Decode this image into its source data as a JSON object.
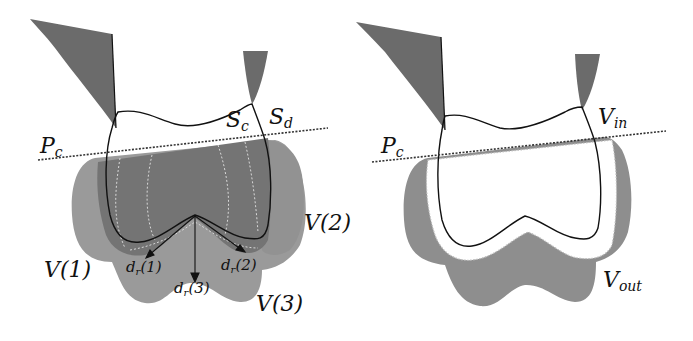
{
  "figure": {
    "panels": [
      {
        "id": "left",
        "labels": {
          "plane": {
            "main": "P",
            "sub": "c"
          },
          "surface_c": {
            "main": "S",
            "sub": "c"
          },
          "surface_d": {
            "main": "S",
            "sub": "d"
          },
          "volume_1": "V(1)",
          "volume_2": "V(2)",
          "volume_3": "V(3)",
          "dir_1": {
            "main": "d",
            "sub": "r",
            "tail": "(1)"
          },
          "dir_2": {
            "main": "d",
            "sub": "r",
            "tail": "(2)"
          },
          "dir_3": {
            "main": "d",
            "sub": "r",
            "tail": "(3)"
          }
        }
      },
      {
        "id": "right",
        "labels": {
          "plane": {
            "main": "P",
            "sub": "c"
          },
          "volume_in": {
            "main": "V",
            "sub": "in"
          },
          "volume_out": {
            "main": "V",
            "sub": "out"
          }
        }
      }
    ],
    "colors": {
      "background": "#ffffff",
      "tissue_dark": "#6b6b6b",
      "volume_light": "#9a9a9a",
      "volume_mid": "#8a8a8a",
      "volume_dark": "#707070",
      "outline": "#111111",
      "dashed_white": "#d9d9d9"
    }
  }
}
